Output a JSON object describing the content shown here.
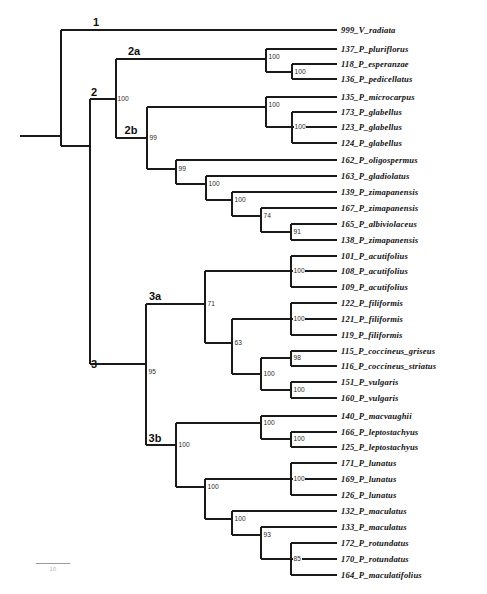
{
  "figure": {
    "type": "phylogenetic-tree",
    "orientation": "rectangular-cladogram-left-to-right",
    "taxon_count": 33
  },
  "scale": {
    "label": "10",
    "bar_length_px": 34
  },
  "tips": [
    {
      "id": "tip-999",
      "label": "999_V_radiata",
      "y": 30
    },
    {
      "id": "tip-137",
      "label": "137_P_pluriflorus",
      "y": 49
    },
    {
      "id": "tip-118",
      "label": "118_P_esperanzae",
      "y": 64
    },
    {
      "id": "tip-136",
      "label": "136_P_pedicellatus",
      "y": 79
    },
    {
      "id": "tip-135",
      "label": "135_P_microcarpus",
      "y": 97
    },
    {
      "id": "tip-173",
      "label": "173_P_glabellus",
      "y": 112
    },
    {
      "id": "tip-123",
      "label": "123_P_glabellus",
      "y": 127
    },
    {
      "id": "tip-124",
      "label": "124_P_glabellus",
      "y": 143
    },
    {
      "id": "tip-162",
      "label": "162_P_oligospermus",
      "y": 160
    },
    {
      "id": "tip-163",
      "label": "163_P_gladiolatus",
      "y": 176
    },
    {
      "id": "tip-139",
      "label": "139_P_zimapanensis",
      "y": 192
    },
    {
      "id": "tip-167",
      "label": "167_P_zimapanensis",
      "y": 208
    },
    {
      "id": "tip-165",
      "label": "165_P_albiviolaceus",
      "y": 224
    },
    {
      "id": "tip-138",
      "label": "138_P_zimapanensis",
      "y": 240
    },
    {
      "id": "tip-101",
      "label": "101_P_acutifolius",
      "y": 256
    },
    {
      "id": "tip-108",
      "label": "108_P_acutifolius",
      "y": 271
    },
    {
      "id": "tip-109",
      "label": "109_P_acutifolius",
      "y": 287
    },
    {
      "id": "tip-122",
      "label": "122_P_filiformis",
      "y": 303
    },
    {
      "id": "tip-121",
      "label": "121_P_filiformis",
      "y": 319
    },
    {
      "id": "tip-119",
      "label": "119_P_filiformis",
      "y": 335
    },
    {
      "id": "tip-115",
      "label": "115_P_coccineus_griseus",
      "y": 351
    },
    {
      "id": "tip-116",
      "label": "116_P_coccineus_striatus",
      "y": 366
    },
    {
      "id": "tip-151",
      "label": "151_P_vulgaris",
      "y": 382
    },
    {
      "id": "tip-160",
      "label": "160_P_vulgaris",
      "y": 398
    },
    {
      "id": "tip-140",
      "label": "140_P_macvaughii",
      "y": 416
    },
    {
      "id": "tip-166",
      "label": "166_P_leptostachyus",
      "y": 432
    },
    {
      "id": "tip-125",
      "label": "125_P_leptostachyus",
      "y": 447
    },
    {
      "id": "tip-171",
      "label": "171_P_lunatus",
      "y": 463
    },
    {
      "id": "tip-169",
      "label": "169_P_lunatus",
      "y": 479
    },
    {
      "id": "tip-126",
      "label": "126_P_lunatus",
      "y": 495
    },
    {
      "id": "tip-132",
      "label": "132_P_maculatus",
      "y": 511
    },
    {
      "id": "tip-133",
      "label": "133_P_maculatus",
      "y": 527
    },
    {
      "id": "tip-172",
      "label": "172_P_rotundatus",
      "y": 543
    },
    {
      "id": "tip-170",
      "label": "170_P_rotundatus",
      "y": 559
    },
    {
      "id": "tip-164",
      "label": "164_P_maculatifolius",
      "y": 575
    }
  ],
  "clade_labels": [
    {
      "id": "clade-1",
      "label": "1",
      "x": 96,
      "y": 22
    },
    {
      "id": "clade-2",
      "label": "2",
      "x": 94,
      "y": 92
    },
    {
      "id": "clade-2a",
      "label": "2a",
      "x": 134,
      "y": 51
    },
    {
      "id": "clade-2b",
      "label": "2b",
      "x": 131,
      "y": 130
    },
    {
      "id": "clade-3",
      "label": "3",
      "x": 94,
      "y": 364
    },
    {
      "id": "clade-3a",
      "label": "3a",
      "x": 155,
      "y": 296
    },
    {
      "id": "clade-3b",
      "label": "3b",
      "x": 155,
      "y": 438
    }
  ],
  "support_values": [
    {
      "id": "support-clade2",
      "value": "100",
      "x": 117,
      "y": 99
    },
    {
      "id": "support-2a-inner1",
      "value": "100",
      "x": 268,
      "y": 57
    },
    {
      "id": "support-2a-inner2",
      "value": "100",
      "x": 294,
      "y": 72
    },
    {
      "id": "support-clade2b",
      "value": "99",
      "x": 149,
      "y": 138
    },
    {
      "id": "support-glabellus1",
      "value": "100",
      "x": 268,
      "y": 105
    },
    {
      "id": "support-glabellus2",
      "value": "100",
      "x": 294,
      "y": 127
    },
    {
      "id": "support-oligo",
      "value": "99",
      "x": 178,
      "y": 169
    },
    {
      "id": "support-zimap1",
      "value": "100",
      "x": 208,
      "y": 184
    },
    {
      "id": "support-zimap2",
      "value": "100",
      "x": 234,
      "y": 200
    },
    {
      "id": "support-zimap3",
      "value": "74",
      "x": 263,
      "y": 216
    },
    {
      "id": "support-zimap4",
      "value": "91",
      "x": 293,
      "y": 232
    },
    {
      "id": "support-clade3",
      "value": "95",
      "x": 148,
      "y": 372
    },
    {
      "id": "support-clade3a",
      "value": "71",
      "x": 207,
      "y": 304
    },
    {
      "id": "support-acutifolius",
      "value": "100",
      "x": 293,
      "y": 271
    },
    {
      "id": "support-63",
      "value": "63",
      "x": 234,
      "y": 343
    },
    {
      "id": "support-filiformis",
      "value": "100",
      "x": 293,
      "y": 319
    },
    {
      "id": "support-cocc-vulg",
      "value": "100",
      "x": 263,
      "y": 374
    },
    {
      "id": "support-coccineus",
      "value": "98",
      "x": 293,
      "y": 358
    },
    {
      "id": "support-vulgaris",
      "value": "100",
      "x": 293,
      "y": 390
    },
    {
      "id": "support-clade3b",
      "value": "100",
      "x": 178,
      "y": 445
    },
    {
      "id": "support-lepto1",
      "value": "100",
      "x": 263,
      "y": 423
    },
    {
      "id": "support-lepto2",
      "value": "100",
      "x": 293,
      "y": 439
    },
    {
      "id": "support-lower",
      "value": "100",
      "x": 207,
      "y": 487
    },
    {
      "id": "support-lunatus",
      "value": "100",
      "x": 293,
      "y": 479
    },
    {
      "id": "support-macul1",
      "value": "100",
      "x": 234,
      "y": 519
    },
    {
      "id": "support-macul2",
      "value": "93",
      "x": 263,
      "y": 535
    },
    {
      "id": "support-rotund",
      "value": "85",
      "x": 293,
      "y": 559
    }
  ],
  "tree_edges": {
    "description": "Rectangular cladogram branch segments drawn as SVG polylines."
  }
}
